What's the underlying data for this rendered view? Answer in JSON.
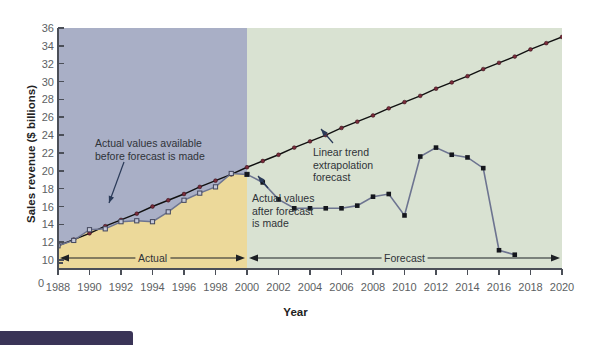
{
  "chart_data": {
    "type": "line",
    "title": "",
    "xlabel": "Year",
    "ylabel": "Sales revenue ($ billions)",
    "xlim": [
      1988,
      2020
    ],
    "ylim": [
      9,
      36
    ],
    "y_axis_break_at": 0,
    "grid": false,
    "legend": "none",
    "xticks": [
      1988,
      1990,
      1992,
      1994,
      1996,
      1998,
      2000,
      2002,
      2004,
      2006,
      2008,
      2010,
      2012,
      2014,
      2016,
      2018,
      2020
    ],
    "yticks": [
      0,
      10,
      12,
      14,
      16,
      18,
      20,
      22,
      24,
      26,
      28,
      30,
      32,
      34,
      36
    ],
    "forecast_origin_year": 2000,
    "series": [
      {
        "name": "Actual values available before forecast is made",
        "marker": "square-open",
        "color": "#6d7490",
        "x": [
          1988,
          1989,
          1990,
          1991,
          1992,
          1993,
          1994,
          1995,
          1996,
          1997,
          1998,
          1999,
          2000
        ],
        "values": [
          11.6,
          12.2,
          13.4,
          13.5,
          14.3,
          14.4,
          14.3,
          15.4,
          16.7,
          17.5,
          18.2,
          19.7,
          19.6
        ]
      },
      {
        "name": "Actual values after forecast is made",
        "marker": "square-filled",
        "color": "#6d7490",
        "x": [
          2000,
          2001,
          2002,
          2003,
          2004,
          2005,
          2006,
          2007,
          2008,
          2009,
          2010,
          2011,
          2012,
          2013,
          2014,
          2015,
          2016,
          2017
        ],
        "values": [
          19.6,
          18.7,
          16.8,
          15.8,
          15.8,
          15.8,
          15.8,
          16.1,
          17.1,
          17.4,
          15.0,
          21.6,
          22.6,
          21.8,
          21.5,
          20.3,
          11.1,
          10.6
        ]
      },
      {
        "name": "Linear trend extrapolation forecast",
        "marker": "circle-filled",
        "color": "#7a2b3a",
        "line_color": "#111111",
        "x": [
          1988,
          1989,
          1990,
          1991,
          1992,
          1993,
          1994,
          1995,
          1996,
          1997,
          1998,
          1999,
          2000,
          2001,
          2002,
          2003,
          2004,
          2005,
          2006,
          2007,
          2008,
          2009,
          2010,
          2011,
          2012,
          2013,
          2014,
          2015,
          2016,
          2017,
          2018,
          2019,
          2020
        ],
        "values": [
          11.6,
          12.3,
          13.0,
          13.8,
          14.5,
          15.2,
          16.0,
          16.7,
          17.4,
          18.2,
          18.9,
          19.6,
          20.4,
          21.1,
          21.8,
          22.6,
          23.3,
          24.0,
          24.8,
          25.5,
          26.2,
          27.0,
          27.7,
          28.4,
          29.2,
          29.9,
          30.6,
          31.4,
          32.1,
          32.8,
          33.6,
          34.3,
          35.0
        ]
      }
    ],
    "annotations": [
      {
        "id": "before",
        "text": "Actual values available\nbefore forecast is made",
        "target_year": 1991,
        "target_value": 13.5
      },
      {
        "id": "after",
        "text": "Actual values\nafter forecast\nis made",
        "target_year": 2002,
        "target_value": 16.8
      },
      {
        "id": "trend",
        "text": "Linear trend\nextrapolation\nforecast",
        "target_year": 2005,
        "target_value": 24.0
      }
    ],
    "span_bars": [
      {
        "label": "Actual",
        "from_year": 1988,
        "to_year": 2000
      },
      {
        "label": "Forecast",
        "from_year": 2000,
        "to_year": 2020
      }
    ],
    "region_fills": [
      {
        "name": "actual-area",
        "color": "#ecd99a"
      },
      {
        "name": "forecast-area",
        "color": "#d9e2d2"
      },
      {
        "name": "plot-background",
        "color": "#a9afc6"
      }
    ]
  },
  "annotations_text": {
    "before": [
      "Actual values available",
      "before forecast is made"
    ],
    "after": [
      "Actual values",
      "after forecast",
      "is made"
    ],
    "trend": [
      "Linear trend",
      "extrapolation",
      "forecast"
    ]
  },
  "axis": {
    "y_title": "Sales revenue ($ billions)",
    "x_title": "Year",
    "zero_label": "0"
  },
  "spans": {
    "actual_label": "Actual",
    "forecast_label": "Forecast"
  }
}
